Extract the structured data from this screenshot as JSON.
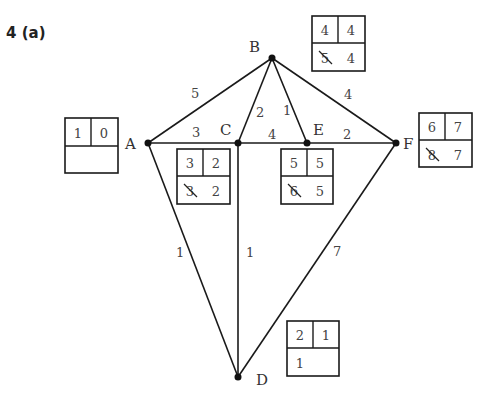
{
  "title": "4 (a)",
  "nodes": [
    {
      "id": "A",
      "x": 148,
      "y": 143
    },
    {
      "id": "B",
      "x": 272,
      "y": 58
    },
    {
      "id": "C",
      "x": 238,
      "y": 143
    },
    {
      "id": "E",
      "x": 307,
      "y": 143
    },
    {
      "id": "F",
      "x": 396,
      "y": 143
    },
    {
      "id": "D",
      "x": 238,
      "y": 377
    }
  ],
  "edges": [
    {
      "from": "A",
      "to": "B",
      "weight": "5"
    },
    {
      "from": "A",
      "to": "C",
      "weight": "3"
    },
    {
      "from": "A",
      "to": "D",
      "weight": "1"
    },
    {
      "from": "B",
      "to": "C",
      "weight": "2"
    },
    {
      "from": "B",
      "to": "E",
      "weight": "1"
    },
    {
      "from": "B",
      "to": "F",
      "weight": "4"
    },
    {
      "from": "C",
      "to": "E",
      "weight": "4"
    },
    {
      "from": "C",
      "to": "D",
      "weight": "1"
    },
    {
      "from": "E",
      "to": "F",
      "weight": "2"
    },
    {
      "from": "F",
      "to": "D",
      "weight": "7"
    }
  ],
  "boxes": {
    "A": {
      "order": "1",
      "final": "0",
      "working": [],
      "struck": []
    },
    "B": {
      "order": "4",
      "final": "4",
      "working": [
        "5",
        "4"
      ],
      "struck": [
        "5"
      ]
    },
    "C": {
      "order": "3",
      "final": "2",
      "working": [
        "3",
        "2"
      ],
      "struck": [
        "3"
      ]
    },
    "E": {
      "order": "5",
      "final": "5",
      "working": [
        "6",
        "5"
      ],
      "struck": [
        "6"
      ]
    },
    "F": {
      "order": "6",
      "final": "7",
      "working": [
        "8",
        "7"
      ],
      "struck": [
        "8"
      ]
    },
    "D": {
      "order": "2",
      "final": "1",
      "working": [
        "1"
      ],
      "struck": []
    }
  }
}
